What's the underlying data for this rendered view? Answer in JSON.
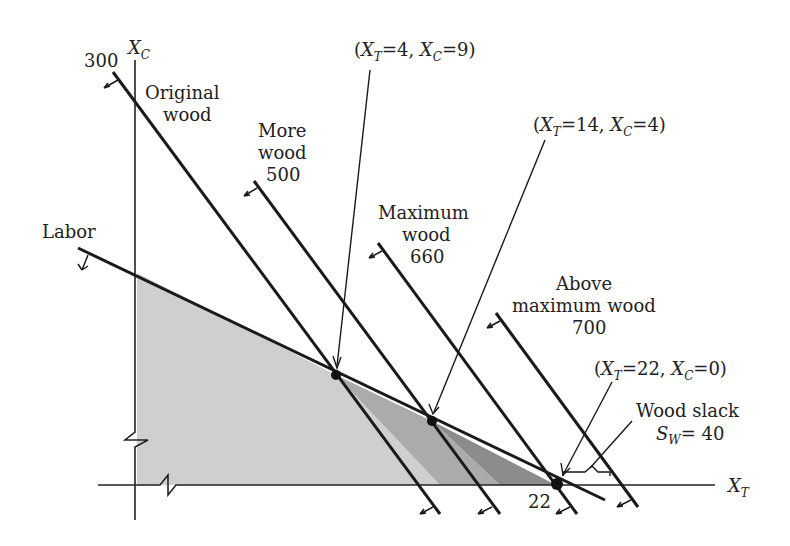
{
  "axes": {
    "x_label": "X",
    "x_label_sub": "T",
    "y_label": "X",
    "y_label_sub": "C",
    "y_intercept_label": "300",
    "x_intercept_label": "22"
  },
  "constraints": {
    "labor": {
      "label": "Labor"
    },
    "original_wood": {
      "label_line1": "Original",
      "label_line2": "wood"
    },
    "more_wood": {
      "label_line1": "More",
      "label_line2": "wood",
      "value": "500"
    },
    "maximum_wood": {
      "label_line1": "Maximum",
      "label_line2": "wood",
      "value": "660"
    },
    "above_maximum_wood": {
      "label_line1": "Above",
      "label_line2": "maximum wood",
      "value": "700"
    }
  },
  "points": {
    "p1": {
      "label": "(X_T=4, X_C=9)",
      "open": "(",
      "xt": "X",
      "xt_sub": "T",
      "xt_val": "=4, ",
      "xc": "X",
      "xc_sub": "C",
      "xc_val": "=9)"
    },
    "p2": {
      "label": "(X_T=14, X_C=4)",
      "open": "(",
      "xt": "X",
      "xt_sub": "T",
      "xt_val": "=14, ",
      "xc": "X",
      "xc_sub": "C",
      "xc_val": "=4)"
    },
    "p3": {
      "label": "(X_T=22, X_C=0)",
      "open": "(",
      "xt": "X",
      "xt_sub": "T",
      "xt_val": "=22, ",
      "xc": "X",
      "xc_sub": "C",
      "xc_val": "=0)"
    }
  },
  "slack": {
    "label": "Wood slack",
    "var": "S",
    "var_sub": "W",
    "value": "= 40"
  },
  "colors": {
    "line": "#1a1a1a",
    "region_light": "#cfcfcf",
    "region_mid": "#a9a9a9",
    "region_dark": "#8a8a8a"
  }
}
